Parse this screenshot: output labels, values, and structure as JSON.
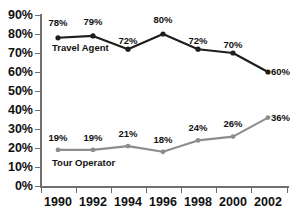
{
  "chart_data": {
    "type": "line",
    "title": "",
    "xlabel": "",
    "ylabel": "",
    "categories": [
      "1990",
      "1992",
      "1994",
      "1996",
      "1998",
      "2000",
      "2002"
    ],
    "ylim": [
      0,
      90
    ],
    "ytick_labels": [
      "90%",
      "80%",
      "70%",
      "60%",
      "50%",
      "40%",
      "30%",
      "20%",
      "10%",
      "0%"
    ],
    "ytick_values": [
      90,
      80,
      70,
      60,
      50,
      40,
      30,
      20,
      10,
      0
    ],
    "grid": false,
    "legend": "inline-series-labels",
    "series": [
      {
        "name": "Travel Agent",
        "color": "#1d1d1d",
        "marker": "filled-circle",
        "values": [
          78,
          79,
          72,
          80,
          72,
          70,
          60
        ],
        "value_labels": [
          "78%",
          "79%",
          "72%",
          "80%",
          "72%",
          "70%",
          "60%"
        ]
      },
      {
        "name": "Tour Operator",
        "color": "#8d8d8d",
        "marker": "filled-circle",
        "values": [
          19,
          19,
          21,
          18,
          24,
          26,
          36
        ],
        "value_labels": [
          "19%",
          "19%",
          "21%",
          "18%",
          "24%",
          "26%",
          "36%"
        ]
      }
    ]
  },
  "axes": {
    "y_labels": [
      "90%",
      "80%",
      "70%",
      "60%",
      "50%",
      "40%",
      "30%",
      "20%",
      "10%",
      "0%"
    ],
    "x_labels": [
      "1990",
      "1992",
      "1994",
      "1996",
      "1998",
      "2000",
      "2002"
    ]
  },
  "series_labels": {
    "travel_agent": "Travel Agent",
    "tour_operator": "Tour Operator"
  },
  "travel_agent_labels": {
    "p0": "78%",
    "p1": "79%",
    "p2": "72%",
    "p3": "80%",
    "p4": "72%",
    "p5": "70%",
    "p6": "60%"
  },
  "tour_operator_labels": {
    "p0": "19%",
    "p1": "19%",
    "p2": "21%",
    "p3": "18%",
    "p4": "24%",
    "p5": "26%",
    "p6": "36%"
  },
  "decor": {
    "title_remnant": "",
    "edge_remnant": ""
  }
}
